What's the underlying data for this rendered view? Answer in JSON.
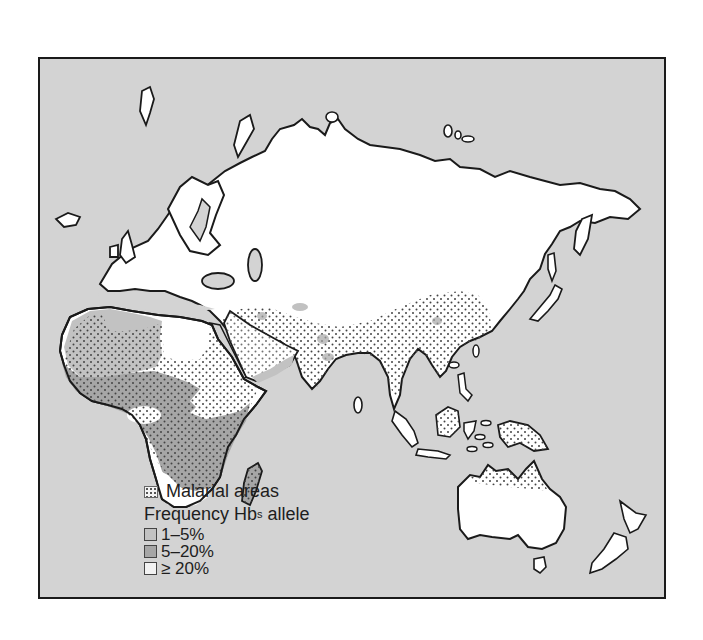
{
  "colors": {
    "background": "#ffffff",
    "sea": "#d3d3d3",
    "frame_border": "#1a1a1a",
    "land_low": "#ffffff",
    "freq_1_5": "#c2c2c2",
    "freq_5_20": "#a6a6a6",
    "freq_ge_20": "#f2f2f2",
    "coastline": "#1a1a1a",
    "stipple": "#444444"
  },
  "legend": {
    "malaria_label": "Malarial areas",
    "title_main": "Frequency Hb",
    "title_sup": "s",
    "title_tail": " allele",
    "items": [
      {
        "label": "1–5%",
        "color": "#c2c2c2"
      },
      {
        "label": "5–20%",
        "color": "#a6a6a6"
      },
      {
        "label": "≥ 20%",
        "color": "#f2f2f2"
      }
    ]
  },
  "regions": {
    "continents": [
      "Europe",
      "Asia",
      "Africa",
      "Australia",
      "New Zealand",
      "Madagascar",
      "Southeast Asian islands",
      "Iceland",
      "Svalbard",
      "Novaya Zemlya",
      "Japan",
      "Sri Lanka",
      "New Guinea",
      "Tasmania"
    ],
    "malarial_areas": [
      "Sub-Saharan Africa",
      "Nile valley",
      "Arabian Peninsula",
      "Middle East",
      "South Asia",
      "Southeast Asia",
      "Southern China",
      "Indonesia",
      "New Guinea",
      "Northern Australia"
    ],
    "hbs_1_5": [
      "North-west Africa",
      "Southern Arabia",
      "Madagascar (partial)",
      "Patches in India",
      "Patches in Middle East"
    ],
    "hbs_5_20": [
      "West Africa",
      "Central Africa",
      "East Africa",
      "Madagascar"
    ],
    "hbs_ge_20": [
      "Patches of central-west Africa",
      "Horn of Africa interior"
    ]
  }
}
